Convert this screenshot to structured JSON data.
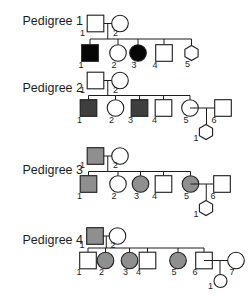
{
  "figure": {
    "width": 252,
    "height": 300,
    "background": "#ffffff"
  },
  "styles": {
    "line_color": "#1c1c1c",
    "shape_stroke": "#1c1c1c",
    "text_color": "#1c1c1c",
    "fills": {
      "white": "#ffffff",
      "black": "#060606",
      "darkgray": "#3e3e3e",
      "gray": "#8f8f8f"
    }
  },
  "legend_shapes": {
    "square": "male",
    "circle": "female",
    "hexagon": "unknown-sex",
    "filled": "affected"
  },
  "pedigrees": [
    {
      "id": "pedigree-1",
      "title": "Pedigree 1",
      "title_pos": {
        "x": 22.5,
        "y": 25
      },
      "parents": {
        "cy": 23.5,
        "father": {
          "shape": "square",
          "fill": "white",
          "cx": 95.5,
          "label": "1"
        },
        "mother": {
          "shape": "circle",
          "fill": "white",
          "cx": 120,
          "label": "2"
        }
      },
      "sib_y": 39,
      "children_cy": 53,
      "children": [
        {
          "shape": "square",
          "fill": "black",
          "cx": 90,
          "label": "1"
        },
        {
          "shape": "circle",
          "fill": "white",
          "cx": 118,
          "label": "2"
        },
        {
          "shape": "circle",
          "fill": "black",
          "cx": 138,
          "label": "3"
        },
        {
          "shape": "square",
          "fill": "white",
          "cx": 164,
          "label": "4"
        },
        {
          "shape": "hexagon",
          "fill": "white",
          "cx": 191.5,
          "label": "5"
        }
      ],
      "spouse": null,
      "couple_child": null
    },
    {
      "id": "pedigree-2",
      "title": "Pedigree 2",
      "title_pos": {
        "x": 22.5,
        "y": 92
      },
      "parents": {
        "cy": 80.5,
        "father": {
          "shape": "square",
          "fill": "white",
          "cx": 95.5,
          "label": "1"
        },
        "mother": {
          "shape": "circle",
          "fill": "white",
          "cx": 120,
          "label": "2"
        }
      },
      "sib_y": 95.5,
      "children_cy": 108,
      "children": [
        {
          "shape": "square",
          "fill": "darkgray",
          "cx": 88.5,
          "label": "1"
        },
        {
          "shape": "circle",
          "fill": "white",
          "cx": 115.5,
          "label": "2"
        },
        {
          "shape": "square",
          "fill": "darkgray",
          "cx": 139.5,
          "label": "3"
        },
        {
          "shape": "square",
          "fill": "white",
          "cx": 163.5,
          "label": "4"
        },
        {
          "shape": "circle",
          "fill": "white",
          "cx": 190,
          "label": "5"
        }
      ],
      "spouse": {
        "shape": "square",
        "fill": "white",
        "cx": 223,
        "label": "6",
        "partner_cx": 190
      },
      "couple_child": {
        "shape": "hexagon",
        "fill": "white",
        "cx": 206,
        "cy": 132,
        "label": "1"
      }
    },
    {
      "id": "pedigree-3",
      "title": "Pedigree 3",
      "title_pos": {
        "x": 22.5,
        "y": 173.5
      },
      "parents": {
        "cy": 156,
        "father": {
          "shape": "square",
          "fill": "gray",
          "cx": 95.5,
          "label": "1"
        },
        "mother": {
          "shape": "circle",
          "fill": "white",
          "cx": 120,
          "label": "2"
        }
      },
      "sib_y": 171.5,
      "children_cy": 184,
      "children": [
        {
          "shape": "square",
          "fill": "gray",
          "cx": 88.5,
          "label": "1"
        },
        {
          "shape": "circle",
          "fill": "white",
          "cx": 118,
          "label": "2"
        },
        {
          "shape": "circle",
          "fill": "gray",
          "cx": 140.5,
          "label": "3"
        },
        {
          "shape": "square",
          "fill": "white",
          "cx": 163.5,
          "label": "4"
        },
        {
          "shape": "circle",
          "fill": "gray",
          "cx": 190.5,
          "label": "5"
        }
      ],
      "spouse": {
        "shape": "square",
        "fill": "white",
        "cx": 222,
        "label": "6",
        "partner_cx": 190.5
      },
      "couple_child": {
        "shape": "hexagon",
        "fill": "white",
        "cx": 206,
        "cy": 208,
        "label": "1"
      }
    },
    {
      "id": "pedigree-4",
      "title": "Pedigree 4",
      "title_pos": {
        "x": 22.5,
        "y": 243.5
      },
      "parents": {
        "cy": 236,
        "father": {
          "shape": "square",
          "fill": "gray",
          "cx": 95,
          "label": "1"
        },
        "mother": {
          "shape": "circle",
          "fill": "white",
          "cx": 117.5,
          "label": "2"
        }
      },
      "sib_y": 248,
      "children_cy": 260.5,
      "children": [
        {
          "shape": "square",
          "fill": "white",
          "cx": 88,
          "label": "1"
        },
        {
          "shape": "circle",
          "fill": "gray",
          "cx": 105.5,
          "label": "2"
        },
        {
          "shape": "circle",
          "fill": "gray",
          "cx": 129.5,
          "label": "3"
        },
        {
          "shape": "square",
          "fill": "white",
          "cx": 147.5,
          "label": "4"
        },
        {
          "shape": "circle",
          "fill": "gray",
          "cx": 178,
          "label": "5"
        },
        {
          "shape": "square",
          "fill": "white",
          "cx": 204,
          "label": "6"
        }
      ],
      "spouse": {
        "shape": "circle",
        "fill": "white",
        "cx": 236,
        "label": "7",
        "partner_cx": 204
      },
      "couple_child": {
        "shape": "circle",
        "fill": "white",
        "cx": 220.5,
        "cy": 281,
        "r": 6.5,
        "label": "1"
      }
    }
  ]
}
